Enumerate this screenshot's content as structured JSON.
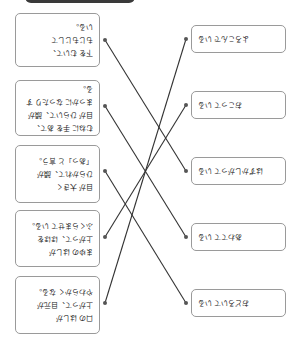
{
  "header_bar": {
    "color": "#3a3a3a"
  },
  "left_items": [
    {
      "lines": [
        "下を むいて、",
        "もじもじして",
        "いる。"
      ],
      "top": 13,
      "height": 54,
      "dot_y": 40
    },
    {
      "lines": [
        "むねに 手を あて、",
        "目が ひらいて、顔が",
        "まっかに なったり する。"
      ],
      "top": 80,
      "height": 56,
      "dot_y": 106
    },
    {
      "lines": [
        "目が 大きく",
        "ひらかれて、顔が",
        "「あっ」と 言う。"
      ],
      "top": 145,
      "height": 58,
      "dot_y": 171
    },
    {
      "lines": [
        "まゆの はしが",
        "上がって、ほほを",
        "ふくらませて いる。"
      ],
      "top": 210,
      "height": 57,
      "dot_y": 237
    },
    {
      "lines": [
        "口の はしが",
        "上がって、目元が",
        "やわらかく なる。"
      ],
      "top": 276,
      "height": 58,
      "dot_y": 303
    }
  ],
  "right_items": [
    {
      "label": "よろこんで いる",
      "top": 25,
      "dot_y": 39
    },
    {
      "label": "おこって いる",
      "top": 91,
      "dot_y": 105
    },
    {
      "label": "はずかしがって いる",
      "top": 157,
      "dot_y": 171
    },
    {
      "label": "あわてて いる",
      "top": 223,
      "dot_y": 237
    },
    {
      "label": "おどろいて いる",
      "top": 289,
      "dot_y": 303
    }
  ],
  "connections": [
    {
      "from": 0,
      "to": 2
    },
    {
      "from": 1,
      "to": 3
    },
    {
      "from": 2,
      "to": 4
    },
    {
      "from": 3,
      "to": 1
    },
    {
      "from": 4,
      "to": 0
    }
  ],
  "line_color": "#333333"
}
